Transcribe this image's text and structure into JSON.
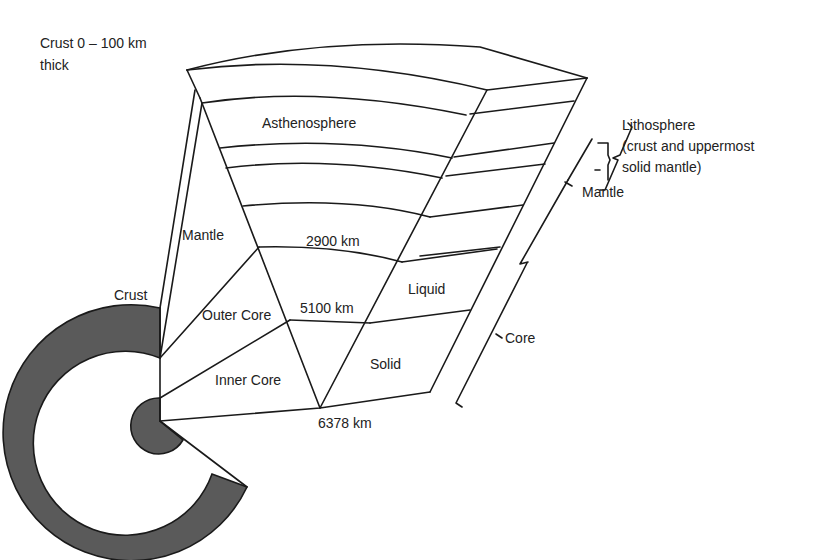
{
  "diagram": {
    "colors": {
      "line": "#1a1a1a",
      "text": "#222222",
      "shade": "#5a5a5a",
      "background": "#ffffff"
    },
    "labels": {
      "crust_note_line1": "Crust 0 – 100 km",
      "crust_note_line2": "thick",
      "asthenosphere": "Asthenosphere",
      "lithosphere_line1": "Lithosphere",
      "lithosphere_line2": "(crust and uppermost",
      "lithosphere_line3": "solid mantle)",
      "mantle_bracket": "Mantle",
      "mantle_wedge": "Mantle",
      "depth_2900": "2900 km",
      "depth_5100": "5100 km",
      "depth_6378": "6378 km",
      "liquid": "Liquid",
      "solid": "Solid",
      "outer_core": "Outer Core",
      "inner_core": "Inner Core",
      "crust": "Crust",
      "core_bracket": "Core"
    }
  }
}
